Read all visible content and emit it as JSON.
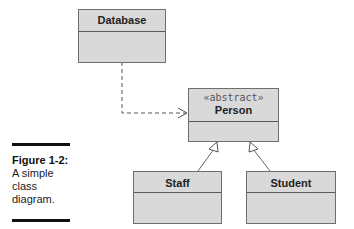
{
  "diagram": {
    "classes": [
      {
        "id": "database",
        "name": "Database"
      },
      {
        "id": "person",
        "stereotype": "«abstract»",
        "name": "Person"
      },
      {
        "id": "staff",
        "name": "Staff"
      },
      {
        "id": "student",
        "name": "Student"
      }
    ],
    "relations": [
      {
        "from": "database",
        "to": "person",
        "type": "dependency"
      },
      {
        "from": "staff",
        "to": "person",
        "type": "generalization"
      },
      {
        "from": "student",
        "to": "person",
        "type": "generalization"
      }
    ]
  },
  "caption": {
    "title": "Figure 1-2:",
    "line1": "A simple",
    "line2": "class",
    "line3": "diagram."
  }
}
